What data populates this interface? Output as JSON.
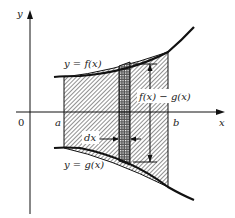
{
  "diagram": {
    "axes": {
      "x_label": "x",
      "y_label": "y",
      "origin_label": "0"
    },
    "bounds": {
      "a_label": "a",
      "b_label": "b"
    },
    "curves": {
      "upper_label": "y = f(x)",
      "lower_label": "y = g(x)"
    },
    "strip": {
      "width_label": "dx",
      "height_label": "f(x) − g(x)"
    },
    "colors": {
      "ink": "#111111",
      "background": "#ffffff"
    }
  }
}
